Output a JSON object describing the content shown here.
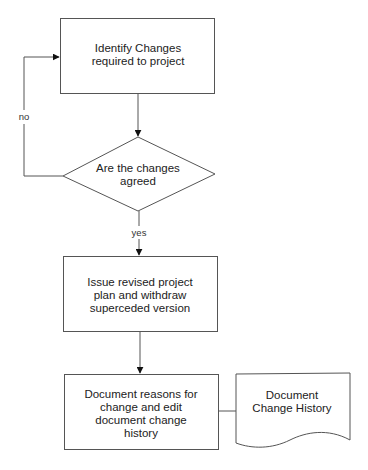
{
  "diagram": {
    "type": "flowchart",
    "nodes": [
      {
        "id": "identify",
        "shape": "process",
        "lines": [
          "Identify Changes",
          "required to project"
        ]
      },
      {
        "id": "agreed",
        "shape": "decision",
        "lines": [
          "Are the changes",
          "agreed"
        ]
      },
      {
        "id": "issue",
        "shape": "process",
        "lines": [
          "Issue revised project",
          "plan and withdraw",
          "superceded version"
        ]
      },
      {
        "id": "document",
        "shape": "process",
        "lines": [
          "Document reasons for",
          "change and edit",
          "document change",
          "history"
        ]
      },
      {
        "id": "history",
        "shape": "document",
        "lines": [
          "Document",
          "Change History"
        ]
      }
    ],
    "edges": [
      {
        "from": "identify",
        "to": "agreed",
        "label": ""
      },
      {
        "from": "agreed",
        "to": "identify",
        "label": "no"
      },
      {
        "from": "agreed",
        "to": "issue",
        "label": "yes"
      },
      {
        "from": "issue",
        "to": "document",
        "label": ""
      },
      {
        "from": "document",
        "to": "history",
        "label": ""
      }
    ]
  },
  "labels": {
    "identify": [
      "Identify Changes",
      "required to project"
    ],
    "agreed": [
      "Are the changes",
      "agreed"
    ],
    "issue": [
      "Issue revised project",
      "plan and withdraw",
      "superceded version"
    ],
    "document": [
      "Document reasons for",
      "change and edit",
      "document change",
      "history"
    ],
    "history": [
      "Document",
      "Change History"
    ],
    "edge_no": "no",
    "edge_yes": "yes"
  },
  "colors": {
    "stroke": "#555555",
    "text": "#222222",
    "background": "#ffffff"
  }
}
